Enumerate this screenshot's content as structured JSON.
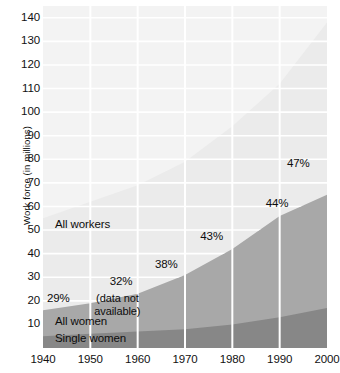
{
  "chart_data": {
    "type": "area",
    "title": "",
    "subtitle": "",
    "xlabel": "",
    "ylabel": "Work force (in millions)",
    "x": [
      1940,
      1950,
      1960,
      1970,
      1980,
      1990,
      2000
    ],
    "xticklabels": [
      "1940",
      "1950",
      "1960",
      "1970",
      "1980",
      "1990",
      "2000"
    ],
    "xlim": [
      1940,
      2000
    ],
    "ylim": [
      0,
      145
    ],
    "yticks": [
      10,
      20,
      30,
      40,
      50,
      60,
      70,
      80,
      90,
      100,
      110,
      120,
      130,
      140
    ],
    "yticklabels": [
      "10",
      "20",
      "30",
      "40",
      "50",
      "60",
      "70",
      "80",
      "90",
      "100",
      "110",
      "120",
      "130",
      "140"
    ],
    "grid": "white gridlines, horizontal at every 10 and vertical at every decade",
    "legend_position": "inline labels inside plot area",
    "stacked": true,
    "series": [
      {
        "name": "Single women",
        "color": "#878787",
        "values": [
          5,
          6,
          7,
          8,
          10,
          13,
          17
        ]
      },
      {
        "name": "All women",
        "color": "#a8a8a8",
        "values": [
          11,
          13,
          16,
          23,
          32,
          43,
          48
        ]
      },
      {
        "name": "All workers",
        "color": "#ebebeb",
        "values": [
          39,
          43,
          46,
          48,
          52,
          56,
          73
        ]
      }
    ],
    "cumulative_tops": {
      "single_women": [
        5,
        6,
        7,
        8,
        10,
        13,
        17
      ],
      "all_women": [
        16,
        19,
        23,
        31,
        42,
        56,
        65
      ],
      "all_workers": [
        55,
        62,
        69,
        79,
        94,
        112,
        138
      ]
    },
    "annotations": [
      {
        "name": "pct-1940",
        "text": "29%",
        "x": 1940,
        "y": 21
      },
      {
        "name": "pct-1960",
        "text": "32%",
        "x": 1960,
        "y": 28
      },
      {
        "name": "pct-1970",
        "text": "38%",
        "x": 1970,
        "y": 35
      },
      {
        "name": "pct-1980",
        "text": "43%",
        "x": 1980,
        "y": 47
      },
      {
        "name": "pct-1990",
        "text": "44%",
        "x": 1990,
        "y": 61
      },
      {
        "name": "pct-2000",
        "text": "47%",
        "x": 2000,
        "y": 78
      }
    ],
    "series_labels": [
      {
        "name": "all-workers-label",
        "text": "All workers"
      },
      {
        "name": "all-women-label",
        "text": "All women"
      },
      {
        "name": "single-women-label",
        "text": "Single women"
      }
    ],
    "note": {
      "line1": "(data not",
      "line2": "available)"
    },
    "colors": {
      "all_workers": "#ebebeb",
      "all_women": "#a8a8a8",
      "single_women": "#878787",
      "background": "#f3f3f3",
      "gridline": "#ffffff",
      "text": "#111111"
    }
  }
}
